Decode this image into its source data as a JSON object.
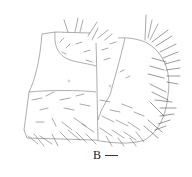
{
  "figure": {
    "panel_label": "B",
    "scale_bar": {
      "visible": true,
      "length_px": 13
    },
    "colors": {
      "line": "#8a8a8a",
      "setae": "#6e6e6e",
      "background": "#ffffff"
    }
  }
}
